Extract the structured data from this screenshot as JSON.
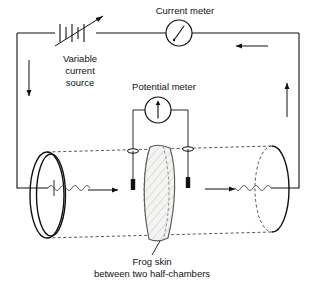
{
  "figure": {
    "background_color": "#ffffff",
    "line_color": "#111111",
    "membrane_fill": "#f4f4f2"
  },
  "labels": {
    "current_meter": "Current meter",
    "potential_meter": "Potential meter",
    "variable_source_line1": "Variable",
    "variable_source_line2": "current",
    "variable_source_line3": "source",
    "frog_skin_line1": "Frog skin",
    "frog_skin_line2": "between two half-chambers"
  },
  "components": [
    {
      "name": "variable-current-source",
      "type": "battery-with-arrow",
      "label": "Variable current source"
    },
    {
      "name": "current-meter",
      "type": "ammeter",
      "needle": "diagonal-up-right",
      "label": "Current meter"
    },
    {
      "name": "potential-meter",
      "type": "voltmeter",
      "needle": "vertical-up",
      "label": "Potential meter"
    },
    {
      "name": "left-electrode-coil",
      "type": "coiled-wire-electrode"
    },
    {
      "name": "right-electrode-coil",
      "type": "coiled-wire-electrode"
    },
    {
      "name": "left-potential-probe",
      "type": "probe-electrode"
    },
    {
      "name": "right-potential-probe",
      "type": "probe-electrode"
    },
    {
      "name": "frog-skin-membrane",
      "type": "hatched-membrane"
    },
    {
      "name": "chamber-cylinder",
      "type": "cylinder"
    }
  ],
  "current_arrows": [
    {
      "name": "arrow-top-right",
      "direction": "left"
    },
    {
      "name": "arrow-right-side",
      "direction": "up"
    },
    {
      "name": "arrow-left-side",
      "direction": "down"
    },
    {
      "name": "arrow-chamber-left",
      "direction": "right"
    },
    {
      "name": "arrow-chamber-right",
      "direction": "right"
    }
  ]
}
